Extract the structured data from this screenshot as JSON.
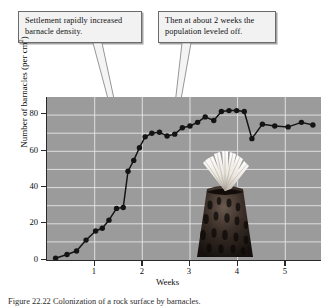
{
  "figure": {
    "caption": "Figure 22.22  Colonization of a rock surface by barnacles.",
    "callouts": [
      {
        "id": "callout-1",
        "text": "Settlement rapidly increased barnacle density."
      },
      {
        "id": "callout-2",
        "text": "Then at about 2 weeks the population leveled off."
      }
    ],
    "photo_label": "barnacle-photograph",
    "colors": {
      "plot_background": "#9b9b9b",
      "gridline": "#e8e8e8",
      "series": "#141414",
      "axis": "#2a2a2a",
      "callout_background": "#f2f2f2",
      "callout_border": "#6b6b6b"
    }
  },
  "chart_data": {
    "type": "line",
    "title": "",
    "xlabel": "Weeks",
    "ylabel": "Number of barnacles (per cm2)",
    "ylabel_display": "Number of barnacles (per cm",
    "ylabel_superscript": "2",
    "ylabel_tail": ")",
    "xlim": [
      0,
      5.75
    ],
    "ylim": [
      0,
      90
    ],
    "grid": true,
    "legend": "none",
    "xticks": [
      1,
      2,
      3,
      4,
      5
    ],
    "yticks": [
      0,
      20,
      40,
      60,
      80
    ],
    "series": [
      {
        "name": "Barnacle density",
        "marker": "filled-circle",
        "x": [
          0.18,
          0.42,
          0.62,
          0.82,
          1.02,
          1.16,
          1.3,
          1.46,
          1.6,
          1.7,
          1.82,
          1.94,
          2.06,
          2.2,
          2.36,
          2.52,
          2.68,
          2.84,
          3.0,
          3.16,
          3.32,
          3.5,
          3.66,
          3.82,
          3.98,
          4.14,
          4.3,
          4.52,
          4.78,
          5.06,
          5.34,
          5.58
        ],
        "y": [
          1.0,
          3.0,
          5.0,
          11.0,
          16.0,
          17.5,
          22.0,
          28.5,
          29.0,
          49.0,
          55.0,
          62.0,
          68.0,
          70.0,
          70.5,
          68.5,
          69.5,
          73.0,
          74.0,
          76.0,
          79.0,
          77.0,
          82.0,
          82.5,
          82.5,
          82.0,
          67.0,
          75.0,
          74.0,
          73.5,
          76.0,
          74.5
        ]
      }
    ]
  }
}
